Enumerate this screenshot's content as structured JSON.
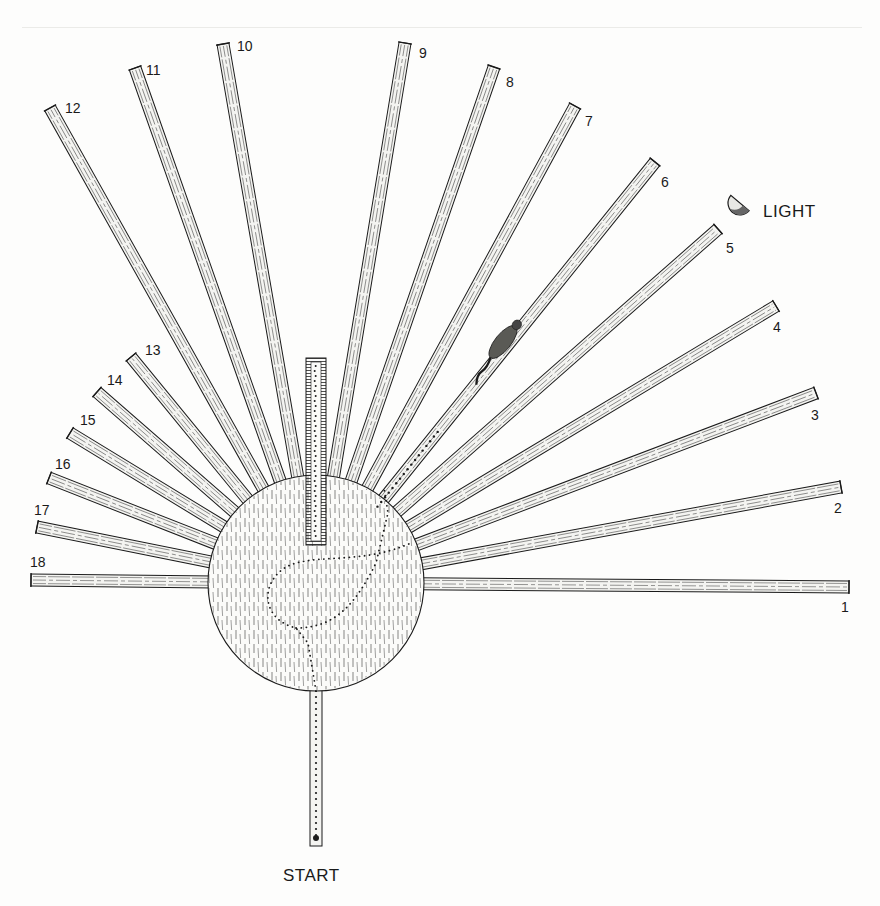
{
  "figure": {
    "type": "radial-maze-diagram",
    "labels": {
      "light": "LIGHT",
      "start": "START"
    },
    "center": {
      "x": 316,
      "y": 583,
      "r": 108
    },
    "arm_width": 12,
    "arms": [
      {
        "id": "1",
        "tip": [
          849,
          587
        ],
        "label_pos": [
          841,
          612
        ]
      },
      {
        "id": "2",
        "tip": [
          841,
          487
        ],
        "label_pos": [
          834,
          513
        ]
      },
      {
        "id": "3",
        "tip": [
          816,
          393
        ],
        "label_pos": [
          811,
          420
        ]
      },
      {
        "id": "4",
        "tip": [
          776,
          306
        ],
        "label_pos": [
          773,
          332
        ]
      },
      {
        "id": "5",
        "tip": [
          718,
          229
        ],
        "label_pos": [
          726,
          253
        ]
      },
      {
        "id": "6",
        "tip": [
          655,
          162
        ],
        "label_pos": [
          661,
          187
        ]
      },
      {
        "id": "7",
        "tip": [
          575,
          106
        ],
        "label_pos": [
          585,
          126
        ]
      },
      {
        "id": "8",
        "tip": [
          494,
          67
        ],
        "label_pos": [
          506,
          87
        ]
      },
      {
        "id": "9",
        "tip": [
          405,
          43
        ],
        "label_pos": [
          419,
          58
        ]
      },
      {
        "id": "10",
        "tip": [
          223,
          44
        ],
        "label_pos": [
          237,
          51
        ]
      },
      {
        "id": "11",
        "tip": [
          135,
          68
        ],
        "label_pos": [
          146,
          75
        ]
      },
      {
        "id": "12",
        "tip": [
          50,
          108
        ],
        "label_pos": [
          65,
          113
        ]
      },
      {
        "id": "13",
        "tip": [
          131,
          357
        ],
        "label_pos": [
          145,
          355
        ]
      },
      {
        "id": "14",
        "tip": [
          97,
          392
        ],
        "label_pos": [
          107,
          385
        ]
      },
      {
        "id": "15",
        "tip": [
          70,
          433
        ],
        "label_pos": [
          80,
          425
        ]
      },
      {
        "id": "16",
        "tip": [
          49,
          478
        ],
        "label_pos": [
          55,
          469
        ]
      },
      {
        "id": "17",
        "tip": [
          37,
          527
        ],
        "label_pos": [
          34,
          515
        ]
      },
      {
        "id": "18",
        "tip": [
          31,
          580
        ],
        "label_pos": [
          30,
          567
        ]
      }
    ],
    "start_arm": {
      "top": [
        316,
        691
      ],
      "bottom": [
        316,
        846
      ]
    },
    "center_runway": {
      "x": 316,
      "y_top": 358,
      "y_bottom": 545
    },
    "light_pos": [
      740,
      203
    ],
    "light_label_pos": [
      763,
      217
    ],
    "start_label_pos": [
      283,
      881
    ],
    "rat": {
      "arm": "6",
      "pos": [
        503,
        342
      ]
    },
    "colors": {
      "ink": "#1a1a1a",
      "paper": "#fdfdfc",
      "arm_fill": "#f4f4f1"
    }
  }
}
